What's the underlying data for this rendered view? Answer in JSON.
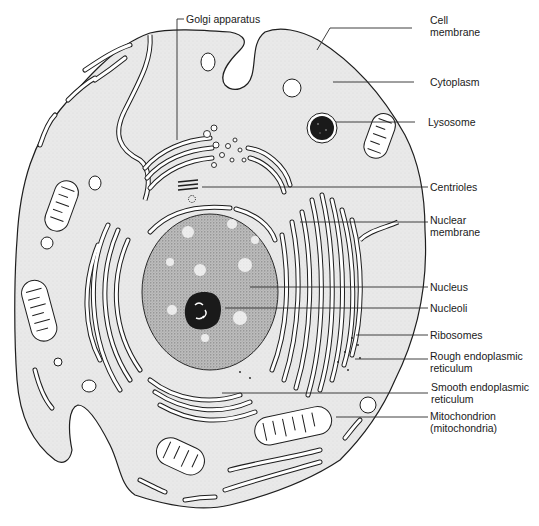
{
  "diagram": {
    "type": "animal-cell-anatomy",
    "colors": {
      "background": "#ffffff",
      "cytoplasm": "#e9e9e9",
      "outline": "#1e1e1e",
      "nucleus": "#b8b8b8",
      "nucleolus": "#1a1a1a",
      "lysosome": "#1a1a1a",
      "organelle_fill": "#ffffff"
    },
    "labels": {
      "golgi": "Golgi apparatus",
      "cell_membrane": [
        "Cell",
        "membrane"
      ],
      "cytoplasm": "Cytoplasm",
      "lysosome": "Lysosome",
      "centrioles": "Centrioles",
      "nuclear_membrane": [
        "Nuclear",
        "membrane"
      ],
      "nucleus": "Nucleus",
      "nucleoli": "Nucleoli",
      "ribosomes": "Ribosomes",
      "rough_er": [
        "Rough endoplasmic",
        "reticulum"
      ],
      "smooth_er": [
        "Smooth endoplasmic",
        "reticulum"
      ],
      "mitochondrion": [
        "Mitochondrion",
        "(mitochondria)"
      ]
    }
  }
}
